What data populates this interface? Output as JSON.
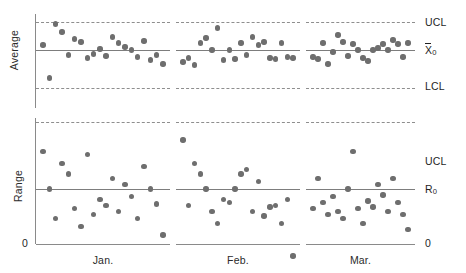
{
  "chart_data": {
    "type": "scatter",
    "title": "",
    "subtitle": "",
    "grid": false,
    "legend": false,
    "panels": [
      {
        "id": "average",
        "ylabel": "Average",
        "center_label": "X̅0",
        "center_label_text": "X",
        "center_label_sub": "0",
        "upper_label": "UCL",
        "lower_label": "LCL",
        "ylim": [
          0,
          100
        ],
        "center_value": 50,
        "ucl_value": 78,
        "lcl_value": 22,
        "has_lcl": true,
        "months": [
          {
            "name": "Jan.",
            "x": [
              1,
              2,
              3,
              4,
              5,
              6,
              7,
              8,
              9,
              10,
              11,
              12,
              13,
              14,
              15,
              16,
              17,
              18,
              19,
              20
            ],
            "y": [
              55,
              22,
              76,
              68,
              45,
              61,
              58,
              42,
              46,
              51,
              44,
              63,
              57,
              53,
              50,
              43,
              59,
              40,
              45,
              36
            ]
          },
          {
            "name": "Feb.",
            "x": [
              1,
              2,
              3,
              4,
              5,
              6,
              7,
              8,
              9,
              10,
              11,
              12,
              13,
              14,
              15,
              16,
              17,
              18,
              19,
              20
            ],
            "y": [
              38,
              42,
              35,
              57,
              62,
              50,
              72,
              40,
              50,
              41,
              57,
              45,
              63,
              55,
              58,
              42,
              41,
              57,
              43,
              42
            ]
          },
          {
            "name": "Mar.",
            "x": [
              1,
              2,
              3,
              4,
              5,
              6,
              7,
              8,
              9,
              10,
              11,
              12,
              13,
              14,
              15,
              16,
              17,
              18,
              19,
              20
            ],
            "y": [
              43,
              41,
              57,
              36,
              48,
              65,
              58,
              44,
              56,
              50,
              42,
              39,
              50,
              52,
              56,
              50,
              60,
              56,
              43,
              57
            ]
          }
        ]
      },
      {
        "id": "range",
        "ylabel": "Range",
        "center_label": "R0",
        "center_label_text": "R",
        "center_label_sub": "0",
        "upper_label": "UCL",
        "lower_label": "0",
        "ylim": [
          0,
          100
        ],
        "center_value": 45,
        "ucl_value": 90,
        "lcl_value": 0,
        "has_lcl": false,
        "months": [
          {
            "name": "Jan.",
            "x": [
              1,
              2,
              3,
              4,
              5,
              6,
              7,
              8,
              9,
              10,
              11,
              12,
              13,
              14,
              15,
              16,
              17,
              18,
              19,
              20
            ],
            "y": [
              70,
              45,
              25,
              62,
              55,
              32,
              20,
              68,
              28,
              38,
              34,
              52,
              30,
              48,
              40,
              25,
              60,
              45,
              35,
              14
            ]
          },
          {
            "name": "Feb.",
            "x": [
              1,
              2,
              3,
              4,
              5,
              6,
              7,
              8,
              9,
              10,
              11,
              12,
              13,
              14,
              15,
              16,
              17,
              18,
              19,
              20
            ],
            "y": [
              78,
              34,
              62,
              55,
              45,
              30,
              22,
              38,
              36,
              45,
              55,
              58,
              30,
              50,
              27,
              33,
              34,
              22,
              38,
              0
            ]
          },
          {
            "name": "Mar.",
            "x": [
              1,
              2,
              3,
              4,
              5,
              6,
              7,
              8,
              9,
              10,
              11,
              12,
              13,
              14,
              15,
              16,
              17,
              18,
              19,
              20
            ],
            "y": [
              32,
              52,
              36,
              28,
              40,
              30,
              25,
              45,
              70,
              32,
              22,
              37,
              33,
              48,
              41,
              30,
              52,
              36,
              28,
              18
            ]
          }
        ]
      }
    ]
  },
  "labels": {
    "average_ylabel": "Average",
    "range_ylabel": "Range",
    "ucl_top": "UCL",
    "xbar0": "X",
    "xbar0_sub": "0",
    "lcl_top": "LCL",
    "ucl_bottom": "UCL",
    "r0": "R",
    "r0_sub": "0",
    "zero_right": "0",
    "zero_left": "0",
    "month_jan": "Jan.",
    "month_feb": "Feb.",
    "month_mar": "Mar."
  },
  "style": {
    "point_color": "#6e6e6e",
    "line_color": "#7d7d7d",
    "dash_color": "#8e8e8e",
    "axis_color": "#8a8a8a",
    "text_color": "#1f1f1f",
    "background": "#ffffff"
  }
}
